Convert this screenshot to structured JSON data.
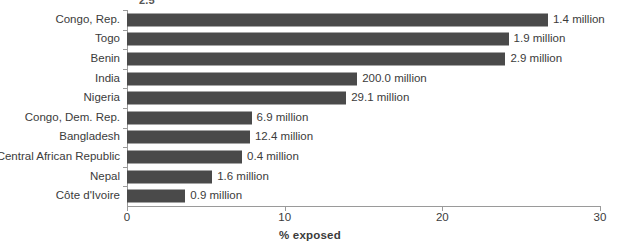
{
  "clipped_top_text": "2.5",
  "chart_data": {
    "type": "bar",
    "orientation": "horizontal",
    "title": "",
    "subtitle": "",
    "xlabel": "% exposed",
    "ylabel": "",
    "xlim": [
      0,
      30
    ],
    "xticks": [
      0,
      10,
      20,
      30
    ],
    "xtick_labels": [
      "0",
      "10",
      "20",
      "30"
    ],
    "grid": false,
    "legend": "none",
    "bar_color": "#4a4a4a",
    "axis_color": "#9a9a9a",
    "text_color": "#3b3b3b",
    "categories": [
      "Congo, Rep.",
      "Togo",
      "Benin",
      "India",
      "Nigeria",
      "Congo, Dem. Rep.",
      "Bangladesh",
      "Central African Republic",
      "Nepal",
      "Côte d'Ivoire"
    ],
    "values": [
      26.7,
      24.2,
      24.0,
      14.6,
      13.9,
      7.9,
      7.8,
      7.3,
      5.4,
      3.7
    ],
    "data_labels": [
      "1.4 million",
      "1.9 million",
      "2.9 million",
      "200.0 million",
      "29.1 million",
      "6.9 million",
      "12.4 million",
      "0.4 million",
      "1.6 million",
      "0.9 million"
    ],
    "exposed_population_millions": [
      1.4,
      1.9,
      2.9,
      200.0,
      29.1,
      6.9,
      12.4,
      0.4,
      1.6,
      0.9
    ]
  }
}
